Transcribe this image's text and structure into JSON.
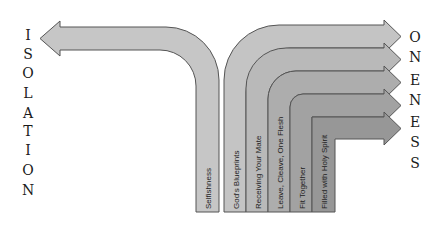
{
  "diagram": {
    "left_word": "ISOLATION",
    "right_word": "ONENESS",
    "left_letters": [
      "I",
      "S",
      "O",
      "L",
      "A",
      "T",
      "I",
      "O",
      "N"
    ],
    "right_letters": [
      "O",
      "N",
      "E",
      "N",
      "E",
      "S",
      "S"
    ],
    "left_arrow": {
      "label": "Selfishness",
      "fill": "#c6c6c6"
    },
    "right_arrows": [
      {
        "label": "God's Blueprints",
        "fill": "#c4c4c4"
      },
      {
        "label": "Receiving Your Mate",
        "fill": "#b9b9b9"
      },
      {
        "label": "Leave, Cleave, One Flesh",
        "fill": "#adadad"
      },
      {
        "label": "Fit Together",
        "fill": "#a2a2a2"
      },
      {
        "label": "Filled with Holy Spirit",
        "fill": "#979797"
      }
    ],
    "stroke": "#555555"
  }
}
